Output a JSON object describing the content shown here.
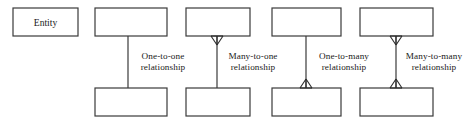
{
  "figure": {
    "background_color": "#ffffff",
    "line_color": "#3a3a3a",
    "text_color": "#1a1a1a"
  },
  "entity_legend": {
    "label": "Entity",
    "box": {
      "x": 13,
      "y": 8,
      "width": 65,
      "height": 28
    }
  },
  "relationships": [
    {
      "id": "one-to-one",
      "label_line1": "One-to-one",
      "label_line2": "relationship",
      "top_box": {
        "x": 95,
        "y": 8,
        "width": 72,
        "height": 28
      },
      "bottom_box": {
        "x": 95,
        "y": 88,
        "width": 72,
        "height": 28
      },
      "connector_x": 128,
      "top_marker": "none",
      "bottom_marker": "none",
      "label_x": 163
    },
    {
      "id": "many-to-one",
      "label_line1": "Many-to-one",
      "label_line2": "relationship",
      "top_box": {
        "x": 186,
        "y": 8,
        "width": 64,
        "height": 28
      },
      "bottom_box": {
        "x": 186,
        "y": 88,
        "width": 64,
        "height": 28
      },
      "connector_x": 217,
      "top_marker": "crowfoot",
      "bottom_marker": "none",
      "label_x": 253
    },
    {
      "id": "one-to-many",
      "label_line1": "One-to-many",
      "label_line2": "relationship",
      "top_box": {
        "x": 272,
        "y": 8,
        "width": 69,
        "height": 28
      },
      "bottom_box": {
        "x": 272,
        "y": 88,
        "width": 69,
        "height": 28
      },
      "connector_x": 306,
      "top_marker": "none",
      "bottom_marker": "crowfoot",
      "label_x": 344
    },
    {
      "id": "many-to-many",
      "label_line1": "Many-to-many",
      "label_line2": "relationship",
      "top_box": {
        "x": 360,
        "y": 8,
        "width": 73,
        "height": 28
      },
      "bottom_box": {
        "x": 360,
        "y": 88,
        "width": 73,
        "height": 28
      },
      "connector_x": 396,
      "top_marker": "crowfoot",
      "bottom_marker": "crowfoot",
      "label_x": 434
    }
  ]
}
